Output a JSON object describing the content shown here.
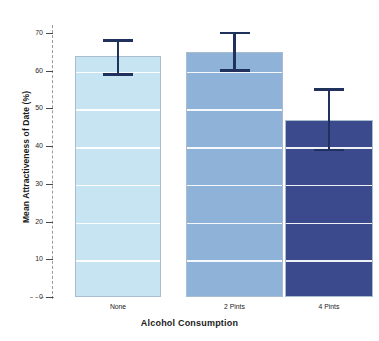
{
  "chart_data": {
    "type": "bar",
    "title": "",
    "xlabel": "Alcohol Consumption",
    "ylabel": "Mean Attractiveness of Date (%)",
    "categories": [
      "None",
      "2 Pints",
      "4 Pints"
    ],
    "values": [
      64,
      65,
      47
    ],
    "error_upper": [
      68,
      70,
      55
    ],
    "error_lower": [
      59,
      60,
      39
    ],
    "ylim": [
      0,
      70
    ],
    "yticks": [
      0,
      10,
      20,
      30,
      40,
      50,
      60,
      70
    ],
    "ytick_labels": [
      "0",
      "10",
      "20",
      "30",
      "40",
      "50",
      "60",
      "70"
    ],
    "grid": true,
    "gridline_color": "#ffffff",
    "legend": "none",
    "bar_colors": [
      "#c7e4f2",
      "#8fb3d8",
      "#3b4a8c"
    ],
    "error_bar_color": "#21315e",
    "axis_color": "#9a9a9a",
    "series": [
      {
        "name": "Mean Attractiveness of Date (%)",
        "values": [
          64,
          65,
          47
        ]
      }
    ]
  },
  "axes": {
    "y_title": "Mean Attractiveness of Date (%)",
    "x_title": "Alcohol Consumption",
    "y_ticks": [
      {
        "label": "70",
        "value": 70
      },
      {
        "label": "60",
        "value": 60
      },
      {
        "label": "50",
        "value": 50
      },
      {
        "label": "40",
        "value": 40
      },
      {
        "label": "30",
        "value": 30
      },
      {
        "label": "20",
        "value": 20
      },
      {
        "label": "10",
        "value": 10
      },
      {
        "label": "0",
        "value": 0
      }
    ]
  },
  "bars": [
    {
      "label": "None",
      "value": 64,
      "upper": 68,
      "lower": 59,
      "color": "#c7e4f2"
    },
    {
      "label": "2 Pints",
      "value": 65,
      "upper": 70,
      "lower": 60,
      "color": "#8fb3d8"
    },
    {
      "label": "4 Pints",
      "value": 47,
      "upper": 55,
      "lower": 39,
      "color": "#3b4a8c"
    }
  ]
}
